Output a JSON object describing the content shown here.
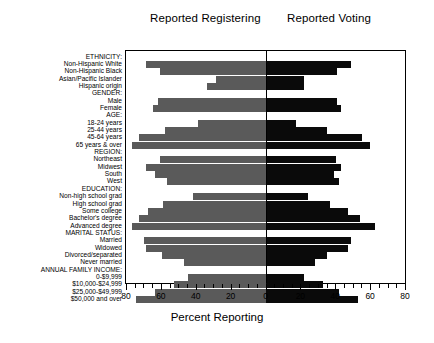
{
  "panels": {
    "left_title": "Reported Registering",
    "right_title": "Reported Voting"
  },
  "axis": {
    "xlabel": "Percent Reporting",
    "ticks": [
      "80",
      "60",
      "40",
      "20",
      "0",
      "20",
      "40",
      "60",
      "80"
    ],
    "tick_values": [
      -80,
      -60,
      -40,
      -20,
      0,
      20,
      40,
      60,
      80
    ],
    "xlim": [
      -80,
      80
    ],
    "minor_step": 5
  },
  "colors": {
    "registering_bar": "#5a5a5a",
    "voting_bar": "#0a0a0a",
    "frame": "#000000",
    "background": "#ffffff"
  },
  "chart_data": {
    "type": "bar",
    "title": "",
    "subtitle": "",
    "xlabel": "Percent Reporting",
    "ylabel": "",
    "xlim": [
      -80,
      80
    ],
    "grid": false,
    "legend_position": "top",
    "orientation": "horizontal",
    "layout": "back-to-back (bidirectional) bar chart; left panel = Reported Registering, right panel = Reported Voting",
    "series": [
      {
        "name": "Reported Registering",
        "side": "left",
        "color": "#5a5a5a"
      },
      {
        "name": "Reported Voting",
        "side": "right",
        "color": "#0a0a0a"
      }
    ],
    "groups": [
      {
        "label": "ETHNICITY:",
        "categories": [
          {
            "label": "Non-Hispanic White",
            "registering": 69,
            "voting": 49
          },
          {
            "label": "Non-Hispanic Black",
            "registering": 61,
            "voting": 41
          },
          {
            "label": "Asian/Pacific Islander",
            "registering": 29,
            "voting": 22
          },
          {
            "label": "Hispanic origin",
            "registering": 34,
            "voting": 22
          }
        ]
      },
      {
        "label": "GENDER:",
        "categories": [
          {
            "label": "Male",
            "registering": 62,
            "voting": 41
          },
          {
            "label": "Female",
            "registering": 65,
            "voting": 43
          }
        ]
      },
      {
        "label": "AGE:",
        "categories": [
          {
            "label": "18-24 years",
            "registering": 39,
            "voting": 17
          },
          {
            "label": "25-44 years",
            "registering": 58,
            "voting": 35
          },
          {
            "label": "45-64 years",
            "registering": 73,
            "voting": 55
          },
          {
            "label": "65 years & over",
            "registering": 77,
            "voting": 60
          }
        ]
      },
      {
        "label": "REGION:",
        "categories": [
          {
            "label": "Northeast",
            "registering": 61,
            "voting": 40
          },
          {
            "label": "Midwest",
            "registering": 69,
            "voting": 43
          },
          {
            "label": "South",
            "registering": 64,
            "voting": 39
          },
          {
            "label": "West",
            "registering": 57,
            "voting": 42
          }
        ]
      },
      {
        "label": "EDUCATION:",
        "categories": [
          {
            "label": "Non-high school grad",
            "registering": 42,
            "voting": 24
          },
          {
            "label": "High school grad",
            "registering": 59,
            "voting": 37
          },
          {
            "label": "Some college",
            "registering": 68,
            "voting": 47
          },
          {
            "label": "Bachelor's degree",
            "registering": 73,
            "voting": 54
          },
          {
            "label": "Advanced degree",
            "registering": 77,
            "voting": 63
          }
        ]
      },
      {
        "label": "MARITAL STATUS:",
        "categories": [
          {
            "label": "Married",
            "registering": 70,
            "voting": 49
          },
          {
            "label": "Widowed",
            "registering": 69,
            "voting": 47
          },
          {
            "label": "Divorced/separated",
            "registering": 60,
            "voting": 35
          },
          {
            "label": "Never married",
            "registering": 47,
            "voting": 28
          }
        ]
      },
      {
        "label": "ANNUAL FAMILY INCOME:",
        "categories": [
          {
            "label": "0-$9,999",
            "registering": 45,
            "voting": 22
          },
          {
            "label": "$10,000-$24,999",
            "registering": 53,
            "voting": 33
          },
          {
            "label": "$25,000-$49,999",
            "registering": 64,
            "voting": 42
          },
          {
            "label": "$50,000 and over",
            "registering": 75,
            "voting": 53
          }
        ]
      }
    ]
  }
}
